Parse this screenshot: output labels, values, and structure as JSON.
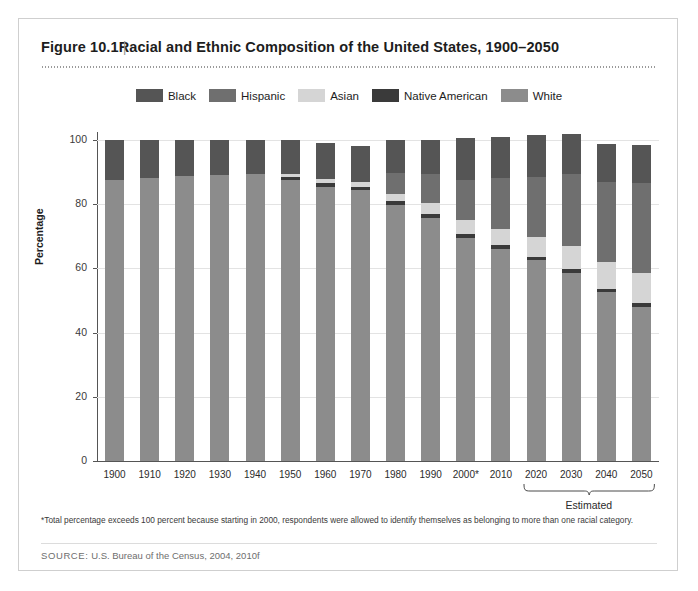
{
  "figure": {
    "number": "Figure 10.1",
    "separator": "|",
    "title": "Racial and Ethnic Composition of the United States, 1900–2050"
  },
  "footnote": "*Total percentage exceeds 100 percent because starting in 2000, respondents were allowed to identify themselves as belonging to more than one racial category.",
  "source_label": "SOURCE:",
  "source_text": "U.S. Bureau of the Census, 2004, 2010f",
  "estimated_label": "Estimated",
  "chart_data": {
    "type": "bar",
    "stacked": true,
    "title": "Racial and Ethnic Composition of the United States, 1900–2050",
    "xlabel": "",
    "ylabel": "Percentage",
    "ylim": [
      0,
      100
    ],
    "yticks": [
      0,
      20,
      40,
      60,
      80,
      100
    ],
    "grid": true,
    "legend_position": "top-center",
    "categories": [
      "1900",
      "1910",
      "1920",
      "1930",
      "1940",
      "1950",
      "1960",
      "1970",
      "1980",
      "1990",
      "2000*",
      "2010",
      "2020",
      "2030",
      "2040",
      "2050"
    ],
    "estimated_categories": [
      "2020",
      "2030",
      "2040",
      "2050"
    ],
    "stack_order": [
      "White",
      "Native American",
      "Asian",
      "Hispanic",
      "Black"
    ],
    "series": [
      {
        "name": "White",
        "color": "#8c8c8c",
        "values": [
          87.5,
          88.3,
          88.8,
          89.2,
          89.4,
          87.5,
          85.5,
          84.3,
          79.8,
          75.8,
          69.5,
          66.0,
          62.5,
          58.5,
          52.5,
          48.0
        ]
      },
      {
        "name": "Native American",
        "color": "#3a3a3a",
        "values": [
          0,
          0,
          0,
          0,
          0,
          1.0,
          1.0,
          1.0,
          1.2,
          1.3,
          1.3,
          1.2,
          1.2,
          1.2,
          1.2,
          1.2
        ]
      },
      {
        "name": "Asian",
        "color": "#d5d5d5",
        "values": [
          0,
          0,
          0,
          0,
          0,
          1.0,
          1.2,
          1.5,
          2.3,
          3.4,
          4.2,
          5.0,
          6.2,
          7.3,
          8.3,
          9.3
        ]
      },
      {
        "name": "Hispanic",
        "color": "#6f6f6f",
        "values": [
          0,
          0,
          0,
          0,
          0,
          0,
          0,
          0,
          6.5,
          9.0,
          12.6,
          16.0,
          18.5,
          22.5,
          24.8,
          28.0
        ]
      },
      {
        "name": "Black",
        "color": "#555555",
        "values": [
          12.5,
          11.7,
          11.2,
          10.8,
          10.6,
          10.5,
          11.3,
          11.2,
          10.2,
          10.5,
          12.9,
          12.6,
          13.1,
          12.5,
          12.0,
          12.0
        ]
      }
    ],
    "totals": [
      100,
      100,
      100,
      100,
      100,
      100,
      100,
      100,
      100,
      100,
      100.5,
      100.8,
      101.5,
      102.0,
      98.8,
      98.5
    ]
  },
  "legend": [
    {
      "label": "Black",
      "color": "#555555"
    },
    {
      "label": "Hispanic",
      "color": "#6f6f6f"
    },
    {
      "label": "Asian",
      "color": "#d5d5d5"
    },
    {
      "label": "Native American",
      "color": "#3a3a3a"
    },
    {
      "label": "White",
      "color": "#8c8c8c"
    }
  ]
}
